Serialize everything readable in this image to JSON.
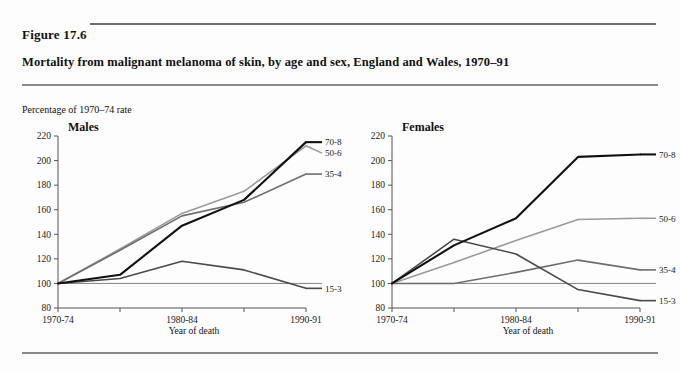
{
  "figure": {
    "number": "Figure 17.6",
    "title": "Mortality from malignant melanoma of skin, by age and sex, England and Wales, 1970–91",
    "y_units_note": "Percentage of 1970–74 rate"
  },
  "chart_data": [
    {
      "type": "line",
      "title": "Males",
      "xlabel": "Year of death",
      "ylabel": "Percentage of 1970–74 rate",
      "categories": [
        "1970-74",
        "1975-79",
        "1980-84",
        "1985-89",
        "1990-91"
      ],
      "xtick_labels": [
        "1970-74",
        "",
        "1980-84",
        "",
        "1990-91"
      ],
      "ylim": [
        80,
        220
      ],
      "yticks": [
        80,
        100,
        120,
        140,
        160,
        180,
        200,
        220
      ],
      "grid": false,
      "legend_position": "right-inline",
      "reference_line": 100,
      "series": [
        {
          "name": "70-84",
          "values": [
            100,
            107,
            147,
            168,
            215
          ],
          "color": "#111111",
          "width": 2.1
        },
        {
          "name": "50-69",
          "values": [
            100,
            128,
            157,
            175,
            212
          ],
          "color": "#9a9a9a",
          "width": 1.6
        },
        {
          "name": "35-49",
          "values": [
            100,
            127,
            155,
            166,
            189
          ],
          "color": "#6e6e6e",
          "width": 1.6
        },
        {
          "name": "15-34",
          "values": [
            100,
            104,
            118,
            111,
            96
          ],
          "color": "#4a4a4a",
          "width": 1.6
        }
      ]
    },
    {
      "type": "line",
      "title": "Females",
      "xlabel": "Year of death",
      "ylabel": "Percentage of 1970–74 rate",
      "categories": [
        "1970-74",
        "1975-79",
        "1980-84",
        "1985-89",
        "1990-91"
      ],
      "xtick_labels": [
        "1970-74",
        "",
        "1980-84",
        "",
        "1990-91"
      ],
      "ylim": [
        80,
        220
      ],
      "yticks": [
        80,
        100,
        120,
        140,
        160,
        180,
        200,
        220
      ],
      "grid": false,
      "legend_position": "right-inline",
      "reference_line": 100,
      "series": [
        {
          "name": "70-84",
          "values": [
            100,
            131,
            153,
            203,
            205
          ],
          "color": "#111111",
          "width": 2.1
        },
        {
          "name": "50-69",
          "values": [
            100,
            117,
            135,
            152,
            153
          ],
          "color": "#9a9a9a",
          "width": 1.6
        },
        {
          "name": "35-49",
          "values": [
            100,
            100,
            109,
            119,
            111
          ],
          "color": "#6e6e6e",
          "width": 1.6
        },
        {
          "name": "15-34",
          "values": [
            100,
            136,
            124,
            95,
            86
          ],
          "color": "#4a4a4a",
          "width": 1.6
        }
      ]
    }
  ],
  "colors": {
    "rule": "#8a8a8a",
    "rule_top": "#6f6f6f",
    "axis": "#555555",
    "reference_line": "#777777",
    "background": "#fdfdfd"
  }
}
